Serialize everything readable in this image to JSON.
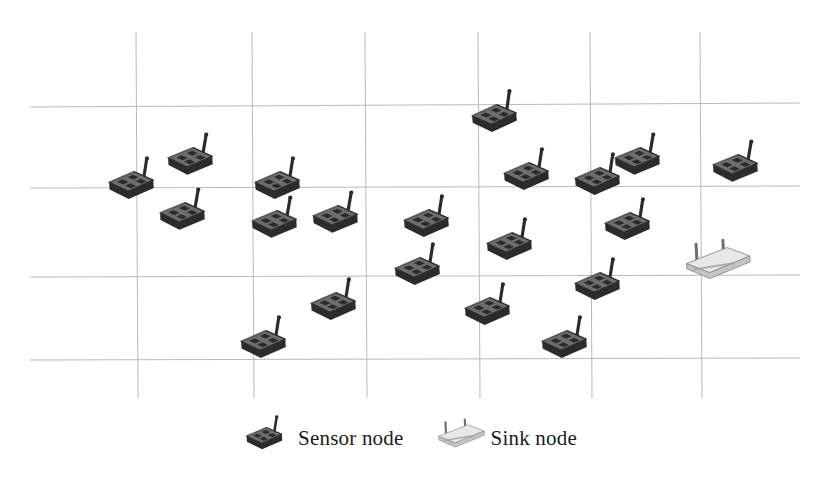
{
  "figure": {
    "kind": "wireless-sensor-network-deployment",
    "background_color": "#ffffff",
    "width": 822,
    "height": 479
  },
  "grid": {
    "line_color": "#b9b9bd",
    "line_width": 1,
    "vertical_lines_x": [
      136,
      252,
      365,
      478,
      590,
      700
    ],
    "vertical_top_y": 32,
    "vertical_bottom_y": 398,
    "horizontal_lines": [
      {
        "y_left": 107,
        "y_right": 103
      },
      {
        "y_left": 188,
        "y_right": 186
      },
      {
        "y_left": 277,
        "y_right": 275
      },
      {
        "y_left": 360,
        "y_right": 358
      }
    ],
    "horizontal_left_x": 30,
    "horizontal_right_x": 800
  },
  "nodes": {
    "sensor_color_dark": "#2b2b2b",
    "sensor_color_mid": "#6d6d6d",
    "sensor_color_light": "#9a9a9a",
    "sink_color_light": "#e8e8e8",
    "sink_color_mid": "#c4c4c4",
    "sink_color_dark": "#8d8d8d",
    "sensor_count": 20,
    "sink_count": 1,
    "sensors": [
      {
        "id": "sensor-01",
        "x": 135,
        "y": 190,
        "scale": 1.0,
        "rot": -4
      },
      {
        "id": "sensor-02",
        "x": 194,
        "y": 166,
        "scale": 1.0,
        "rot": -3
      },
      {
        "id": "sensor-03",
        "x": 186,
        "y": 221,
        "scale": 1.0,
        "rot": -3
      },
      {
        "id": "sensor-04",
        "x": 281,
        "y": 190,
        "scale": 1.0,
        "rot": -4
      },
      {
        "id": "sensor-05",
        "x": 278,
        "y": 229,
        "scale": 1.0,
        "rot": -3
      },
      {
        "id": "sensor-06",
        "x": 339,
        "y": 224,
        "scale": 1.0,
        "rot": -3
      },
      {
        "id": "sensor-07",
        "x": 430,
        "y": 228,
        "scale": 1.0,
        "rot": -4
      },
      {
        "id": "sensor-08",
        "x": 498,
        "y": 123,
        "scale": 1.0,
        "rot": -5
      },
      {
        "id": "sensor-09",
        "x": 530,
        "y": 181,
        "scale": 1.0,
        "rot": -4
      },
      {
        "id": "sensor-10",
        "x": 601,
        "y": 186,
        "scale": 1.0,
        "rot": -4
      },
      {
        "id": "sensor-11",
        "x": 641,
        "y": 166,
        "scale": 1.0,
        "rot": -3
      },
      {
        "id": "sensor-12",
        "x": 739,
        "y": 173,
        "scale": 1.0,
        "rot": -3
      },
      {
        "id": "sensor-13",
        "x": 631,
        "y": 231,
        "scale": 1.0,
        "rot": -4
      },
      {
        "id": "sensor-14",
        "x": 513,
        "y": 251,
        "scale": 1.0,
        "rot": -4
      },
      {
        "id": "sensor-15",
        "x": 421,
        "y": 276,
        "scale": 1.0,
        "rot": -4
      },
      {
        "id": "sensor-16",
        "x": 601,
        "y": 291,
        "scale": 1.0,
        "rot": -4
      },
      {
        "id": "sensor-17",
        "x": 337,
        "y": 311,
        "scale": 1.0,
        "rot": -4
      },
      {
        "id": "sensor-18",
        "x": 491,
        "y": 316,
        "scale": 1.0,
        "rot": -4
      },
      {
        "id": "sensor-19",
        "x": 267,
        "y": 349,
        "scale": 1.0,
        "rot": -4
      },
      {
        "id": "sensor-20",
        "x": 568,
        "y": 349,
        "scale": 1.0,
        "rot": -4
      }
    ],
    "sinks": [
      {
        "id": "sink-01",
        "x": 719,
        "y": 266,
        "scale": 1.0,
        "rot": -3
      }
    ]
  },
  "legend": {
    "items": [
      {
        "icon": "sensor-node-icon",
        "label": "Sensor node"
      },
      {
        "icon": "sink-node-icon",
        "label": "Sink node"
      }
    ]
  }
}
